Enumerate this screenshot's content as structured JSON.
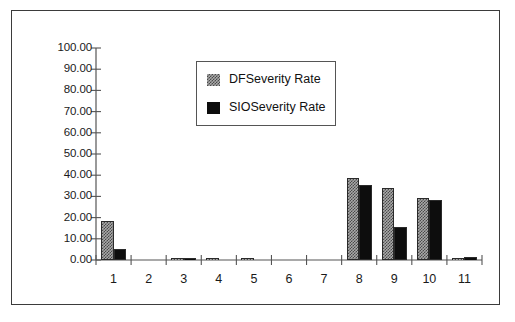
{
  "chart_data": {
    "type": "bar",
    "title": "",
    "subtitle": "",
    "xlabel": "",
    "ylabel": "",
    "ylim": [
      0,
      100
    ],
    "yticks": [
      "0.00",
      "10.00",
      "20.00",
      "30.00",
      "40.00",
      "50.00",
      "60.00",
      "70.00",
      "80.00",
      "90.00",
      "100.00"
    ],
    "ytick_values": [
      0,
      10,
      20,
      30,
      40,
      50,
      60,
      70,
      80,
      90,
      100
    ],
    "grid": false,
    "legend_position": "upper-center",
    "categories": [
      "1",
      "2",
      "3",
      "4",
      "5",
      "6",
      "7",
      "8",
      "9",
      "10",
      "11"
    ],
    "series": [
      {
        "name": "DFSeverity Rate",
        "fill": "checkerboard-gray",
        "color": "#a9a9a9",
        "values": [
          18.5,
          0.0,
          1.0,
          0.1,
          0.1,
          0.0,
          0.0,
          38.5,
          34.2,
          29.4,
          0.3
        ]
      },
      {
        "name": "SIOSeverity Rate",
        "fill": "solid-black",
        "color": "#0d0d0d",
        "values": [
          5.0,
          0.0,
          0.8,
          0.0,
          0.0,
          0.0,
          0.0,
          35.2,
          15.4,
          28.4,
          1.2
        ]
      }
    ]
  },
  "legend": {
    "entries": [
      {
        "label": "DFSeverity Rate",
        "swatch": "df-pattern-swatch"
      },
      {
        "label": "SIOSeverity Rate",
        "swatch": "sio-solid-swatch"
      }
    ]
  },
  "colors": {
    "frame": "#3b3b3b",
    "axis": "#555555",
    "series_df": "#a9a9a9",
    "series_sio": "#0d0d0d",
    "text": "#1a1a1a",
    "background": "#ffffff"
  }
}
